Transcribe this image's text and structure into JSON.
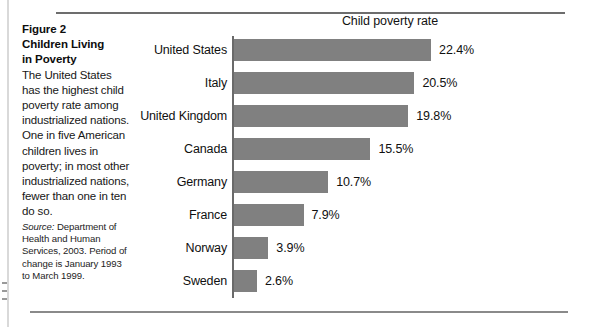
{
  "figure": {
    "title_lines": [
      "Figure 2",
      "Children Living",
      "in Poverty"
    ],
    "body": "The United States has the highest child poverty rate among industrialized nations. One in five American children lives in poverty; in most other industrialized nations, fewer than one in ten do so.",
    "source_label": "Source:",
    "source_text": " Department of Health and Human Services, 2003. Period of change is January 1993 to March 1999."
  },
  "chart_data": {
    "type": "bar",
    "orientation": "horizontal",
    "title": "Child poverty rate",
    "xlabel": "",
    "ylabel": "",
    "grid": false,
    "legend": "none",
    "xlim": [
      0,
      24
    ],
    "bar_color": "#808080",
    "categories": [
      "United States",
      "Italy",
      "United Kingdom",
      "Canada",
      "Germany",
      "France",
      "Norway",
      "Sweden"
    ],
    "values": [
      22.4,
      20.5,
      19.8,
      15.5,
      10.7,
      7.9,
      3.9,
      2.6
    ],
    "value_labels": [
      "22.4%",
      "20.5%",
      "19.8%",
      "15.5%",
      "10.7%",
      "7.9%",
      "3.9%",
      "2.6%"
    ]
  }
}
